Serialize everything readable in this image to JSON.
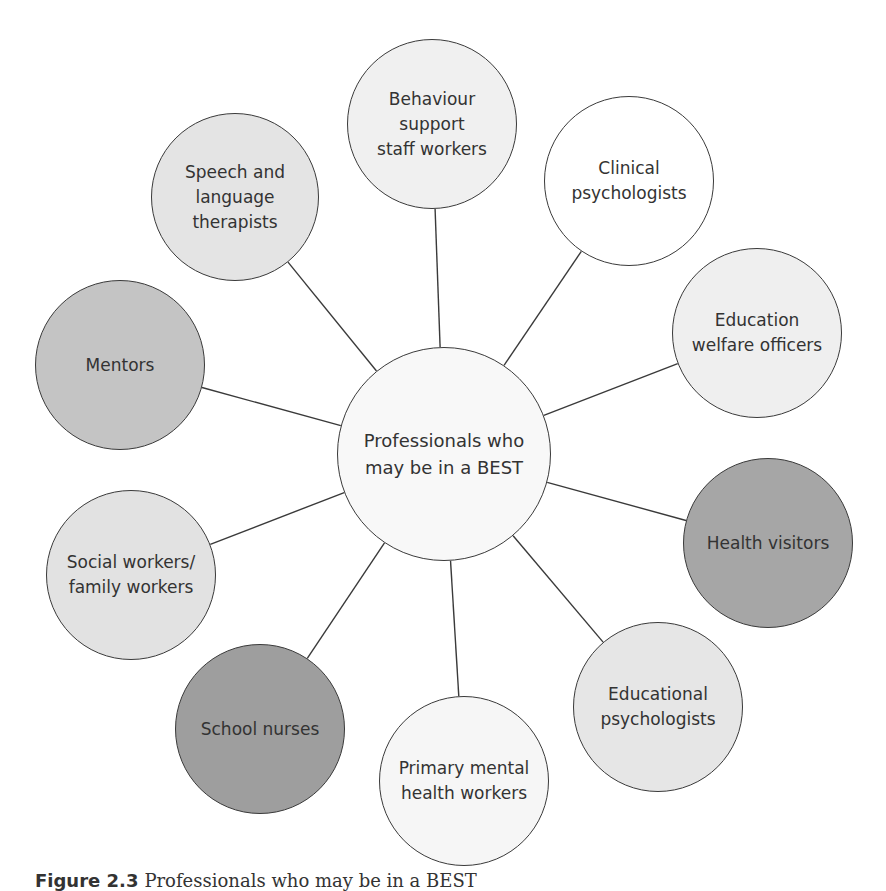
{
  "diagram": {
    "center": {
      "label": "Professionals who\nmay be in a BEST",
      "cx": 444,
      "cy": 454,
      "r": 107,
      "fill": "#f8f8f8"
    },
    "nodes": [
      {
        "id": "behaviour",
        "label": "Behaviour\nsupport\nstaff workers",
        "cx": 432,
        "cy": 124,
        "r": 85,
        "fill": "#f0f0f0"
      },
      {
        "id": "clinical",
        "label": "Clinical\npsychologists",
        "cx": 629,
        "cy": 181,
        "r": 85,
        "fill": "#ffffff"
      },
      {
        "id": "education-welfare",
        "label": "Education\nwelfare officers",
        "cx": 757,
        "cy": 333,
        "r": 85,
        "fill": "#efefef"
      },
      {
        "id": "health-visitors",
        "label": "Health visitors",
        "cx": 768,
        "cy": 543,
        "r": 85,
        "fill": "#a6a6a6"
      },
      {
        "id": "educational-psych",
        "label": "Educational\npsychologists",
        "cx": 658,
        "cy": 707,
        "r": 85,
        "fill": "#e6e6e6"
      },
      {
        "id": "primary-mental",
        "label": "Primary mental\nhealth workers",
        "cx": 464,
        "cy": 781,
        "r": 85,
        "fill": "#f6f6f6"
      },
      {
        "id": "school-nurses",
        "label": "School nurses",
        "cx": 260,
        "cy": 729,
        "r": 85,
        "fill": "#9e9e9e"
      },
      {
        "id": "social-workers",
        "label": "Social workers/\nfamily workers",
        "cx": 131,
        "cy": 575,
        "r": 85,
        "fill": "#e2e2e2"
      },
      {
        "id": "mentors",
        "label": "Mentors",
        "cx": 120,
        "cy": 365,
        "r": 85,
        "fill": "#c4c4c4"
      },
      {
        "id": "speech-language",
        "label": "Speech and\nlanguage\ntherapists",
        "cx": 235,
        "cy": 197,
        "r": 84,
        "fill": "#e4e4e4"
      }
    ],
    "line_color": "#3a3a3a"
  },
  "caption": {
    "figure_number": "Figure 2.3",
    "text": "Professionals who may be in a BEST"
  }
}
